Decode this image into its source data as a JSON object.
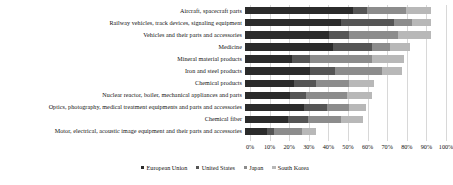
{
  "chart_data": {
    "type": "bar",
    "orientation": "horizontal",
    "stacked": true,
    "title": "",
    "xlabel": "",
    "ylabel": "",
    "xlim": [
      0,
      100
    ],
    "xtick_labels": [
      "0%",
      "10%",
      "20%",
      "30%",
      "40%",
      "50%",
      "60%",
      "70%",
      "80%",
      "90%",
      "100%"
    ],
    "xtick_values": [
      0,
      10,
      20,
      30,
      40,
      50,
      60,
      70,
      80,
      90,
      100
    ],
    "grid": true,
    "legend_position": "bottom",
    "categories": [
      "Aircraft, spacecraft parts",
      "Railway vehicles, track devices, signaling equipment",
      "Vehicles and their parts and accessories",
      "Medicine",
      "Mineral material products",
      "Iron and steel products",
      "Chemical products",
      "Nuclear reactor, boiler, mechanical appliances and parts",
      "Optics, photography, medical treatment equipments and parts and accessories",
      "Chemical fiber",
      "Motor, electrical, acoustic image equipment and their parts and accessories"
    ],
    "series": [
      {
        "name": "European Union",
        "color": "#2b2b2b",
        "values": [
          55,
          49,
          43,
          45,
          24,
          33,
          25,
          23,
          30,
          22,
          11
        ]
      },
      {
        "name": "United States",
        "color": "#555555",
        "values": [
          7,
          27,
          10,
          20,
          9,
          13,
          11,
          8,
          12,
          10,
          4
        ]
      },
      {
        "name": "Japan",
        "color": "#8c8c8c",
        "values": [
          20,
          9,
          25,
          9,
          32,
          24,
          17,
          21,
          11,
          17,
          14
        ]
      },
      {
        "name": "South Korea",
        "color": "#b8b8b8",
        "values": [
          13,
          10,
          17,
          10,
          16,
          10,
          13,
          13,
          9,
          11,
          7
        ]
      }
    ]
  }
}
